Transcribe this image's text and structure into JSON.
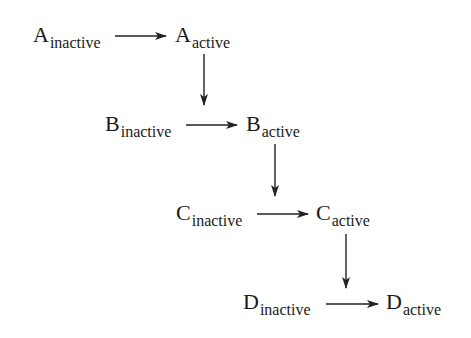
{
  "diagram": {
    "type": "activation cascade",
    "rows": [
      {
        "inactive": {
          "letter": "A",
          "state": "inactive"
        },
        "active": {
          "letter": "A",
          "state": "active"
        }
      },
      {
        "inactive": {
          "letter": "B",
          "state": "inactive"
        },
        "active": {
          "letter": "B",
          "state": "active"
        }
      },
      {
        "inactive": {
          "letter": "C",
          "state": "inactive"
        },
        "active": {
          "letter": "C",
          "state": "active"
        }
      },
      {
        "inactive": {
          "letter": "D",
          "state": "inactive"
        },
        "active": {
          "letter": "D",
          "state": "active"
        }
      }
    ],
    "edges": [
      {
        "from": "A_inactive",
        "to": "A_active",
        "direction": "right"
      },
      {
        "from": "A_active",
        "to": "B_active",
        "direction": "down"
      },
      {
        "from": "B_inactive",
        "to": "B_active",
        "direction": "right"
      },
      {
        "from": "B_active",
        "to": "C_active",
        "direction": "down"
      },
      {
        "from": "C_inactive",
        "to": "C_active",
        "direction": "right"
      },
      {
        "from": "C_active",
        "to": "D_active",
        "direction": "down"
      },
      {
        "from": "D_inactive",
        "to": "D_active",
        "direction": "right"
      }
    ],
    "colors": {
      "text": "#1a1a1a",
      "arrow": "#222222",
      "background": "#ffffff"
    }
  }
}
